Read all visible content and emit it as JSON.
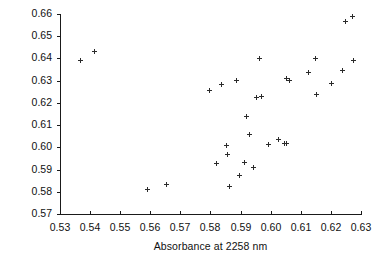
{
  "chart_data": {
    "type": "scatter",
    "title": "",
    "xlabel": "Absorbance at 2258 nm",
    "ylabel": "Absorbance at 2314 nm",
    "xlim": [
      0.53,
      0.63
    ],
    "ylim": [
      0.57,
      0.66
    ],
    "xticks": [
      "0.53",
      "0.54",
      "0.55",
      "0.56",
      "0.57",
      "0.58",
      "0.59",
      "0.60",
      "0.61",
      "0.62",
      "0.63"
    ],
    "yticks": [
      "0.57",
      "0.58",
      "0.59",
      "0.60",
      "0.61",
      "0.62",
      "0.63",
      "0.64",
      "0.65",
      "0.66"
    ],
    "xtick_values": [
      0.53,
      0.54,
      0.55,
      0.56,
      0.57,
      0.58,
      0.59,
      0.6,
      0.61,
      0.62,
      0.63
    ],
    "ytick_values": [
      0.57,
      0.58,
      0.59,
      0.6,
      0.61,
      0.62,
      0.63,
      0.64,
      0.65,
      0.66
    ],
    "grid": false,
    "legend": false,
    "marker": "plus",
    "marker_color": "#2b2b2b",
    "points": [
      {
        "x": 0.5368,
        "y": 0.6389
      },
      {
        "x": 0.5415,
        "y": 0.6432
      },
      {
        "x": 0.5592,
        "y": 0.5811
      },
      {
        "x": 0.5655,
        "y": 0.5831
      },
      {
        "x": 0.5798,
        "y": 0.6258
      },
      {
        "x": 0.582,
        "y": 0.5927
      },
      {
        "x": 0.5838,
        "y": 0.6282
      },
      {
        "x": 0.5852,
        "y": 0.601
      },
      {
        "x": 0.5857,
        "y": 0.5966
      },
      {
        "x": 0.5862,
        "y": 0.5823
      },
      {
        "x": 0.5885,
        "y": 0.6303
      },
      {
        "x": 0.5897,
        "y": 0.5874
      },
      {
        "x": 0.5912,
        "y": 0.593
      },
      {
        "x": 0.5921,
        "y": 0.6139
      },
      {
        "x": 0.593,
        "y": 0.6056
      },
      {
        "x": 0.5944,
        "y": 0.5911
      },
      {
        "x": 0.5952,
        "y": 0.6226
      },
      {
        "x": 0.5963,
        "y": 0.6399
      },
      {
        "x": 0.5968,
        "y": 0.623
      },
      {
        "x": 0.5992,
        "y": 0.6012
      },
      {
        "x": 0.6027,
        "y": 0.6035
      },
      {
        "x": 0.6046,
        "y": 0.6016
      },
      {
        "x": 0.6051,
        "y": 0.6312
      },
      {
        "x": 0.6054,
        "y": 0.6018
      },
      {
        "x": 0.6064,
        "y": 0.63
      },
      {
        "x": 0.6125,
        "y": 0.6338
      },
      {
        "x": 0.6148,
        "y": 0.6402
      },
      {
        "x": 0.6153,
        "y": 0.6238
      },
      {
        "x": 0.6203,
        "y": 0.6288
      },
      {
        "x": 0.624,
        "y": 0.6345
      },
      {
        "x": 0.6248,
        "y": 0.6567
      },
      {
        "x": 0.6272,
        "y": 0.6588
      },
      {
        "x": 0.6275,
        "y": 0.639
      }
    ]
  },
  "axis_geometry": {
    "plot_left": 60,
    "plot_right": 361,
    "plot_top": 14,
    "plot_bottom": 214
  }
}
